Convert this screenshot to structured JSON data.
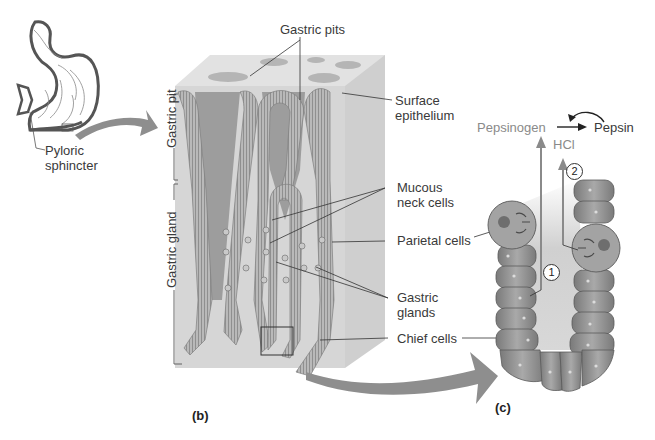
{
  "figure": {
    "panel_a": {
      "labels": {
        "pyloric_sphincter": "Pyloric\nsphincter",
        "pyloric_line1": "Pyloric",
        "pyloric_line2": "sphincter"
      }
    },
    "panel_b": {
      "panel_label": "(b)",
      "labels": {
        "gastric_pits": "Gastric pits",
        "surface_epithelium_1": "Surface",
        "surface_epithelium_2": "epithelium",
        "mucous_neck_1": "Mucous",
        "mucous_neck_2": "neck cells",
        "parietal_cells": "Parietal cells",
        "gastric_glands_1": "Gastric",
        "gastric_glands_2": "glands",
        "chief_cells": "Chief cells",
        "gastric_pit_bracket": "Gastric pit",
        "gastric_gland_bracket": "Gastric gland"
      }
    },
    "panel_c": {
      "panel_label": "(c)",
      "labels": {
        "pepsinogen": "Pepsinogen",
        "pepsin": "Pepsin",
        "hcl": "HCl",
        "step_1": "1",
        "step_2": "2"
      }
    },
    "colors": {
      "tissue_dark": "#8c8c8c",
      "tissue_mid": "#a8a8a8",
      "block_light": "#d6d6d6",
      "block_side": "#c4c4c4",
      "arrow": "#8e8e8e",
      "line": "#333333"
    }
  }
}
